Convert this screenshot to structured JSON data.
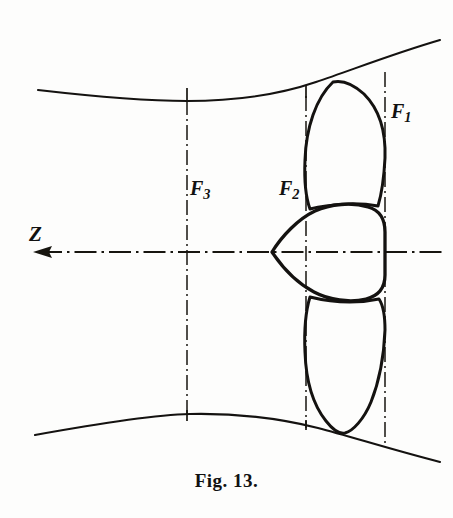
{
  "figure": {
    "caption": "Fig. 13.",
    "domain_kind": "technical-line-drawing",
    "background_color": "#fdfdfc",
    "ink_color": "#141210"
  },
  "labels": {
    "f1": {
      "base": "F",
      "sub": "1",
      "x": 391,
      "y": 100
    },
    "f2": {
      "base": "F",
      "sub": "2",
      "x": 279,
      "y": 177
    },
    "f3": {
      "base": "F",
      "sub": "3",
      "x": 190,
      "y": 177
    },
    "z": {
      "base": "Z",
      "x": 29,
      "y": 222
    }
  },
  "axis": {
    "name": "z-axis",
    "y": 252,
    "x_start": 33,
    "x_end": 446,
    "arrow_direction": "left",
    "arrow_tip_x": 33,
    "style": "dash-dot"
  },
  "station_lines": [
    {
      "name": "F3",
      "x": 187,
      "y_top": 88,
      "y_bottom": 421,
      "style": "dash-dot"
    },
    {
      "name": "F2",
      "x": 306,
      "y_top": 85,
      "y_bottom": 424,
      "style": "dash-dot"
    },
    {
      "name": "F1",
      "x": 385,
      "y_top": 72,
      "y_bottom": 443,
      "style": "dash-dot"
    }
  ],
  "walls": {
    "upper": {
      "name": "upper-duct-wall",
      "description": "converging-diverging nozzle wall, throat near mid-span, rising to the right"
    },
    "lower": {
      "name": "lower-duct-wall",
      "description": "converging-diverging nozzle wall, throat near mid-span, falling to the right"
    }
  },
  "shapes": [
    {
      "name": "upper-blade",
      "description": "pointed leaf-shaped blade above the axis"
    },
    {
      "name": "center-lobe",
      "description": "rounded-triangular hub lobe, apex pointing left along the axis"
    },
    {
      "name": "lower-blade",
      "description": "elongated teardrop blade below the axis"
    }
  ]
}
